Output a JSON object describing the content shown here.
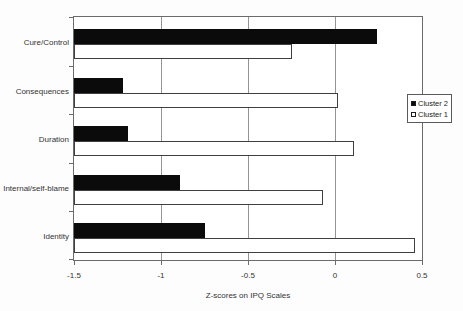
{
  "figure": {
    "background": "#fdfdfd"
  },
  "chart_data": {
    "type": "bar",
    "orientation": "horizontal",
    "title": "",
    "xlabel": "Z-scores on IPQ Scales",
    "ylabel": "",
    "categories": [
      "Cure/Control",
      "Consequences",
      "Duration",
      "Internal/self-blame",
      "Identity"
    ],
    "series": [
      {
        "name": "Cluster 2",
        "color": "#0b0b0b",
        "values": [
          0.24,
          -1.22,
          -1.19,
          -0.89,
          -0.75
        ]
      },
      {
        "name": "Cluster 1",
        "color": "#ffffff",
        "values": [
          -0.25,
          0.02,
          0.11,
          -0.07,
          0.46
        ]
      }
    ],
    "xlim": [
      -1.5,
      0.5
    ],
    "xticks": [
      -1.5,
      -1,
      -0.5,
      0,
      0.5
    ],
    "xtick_labels": [
      "-1.5",
      "-1",
      "-0.5",
      "0",
      "0.5"
    ],
    "bar_base": -1.5,
    "grid": "vertical-gridlines",
    "legend_position": "right",
    "legend_entries": [
      "Cluster 2",
      "Cluster 1"
    ]
  }
}
